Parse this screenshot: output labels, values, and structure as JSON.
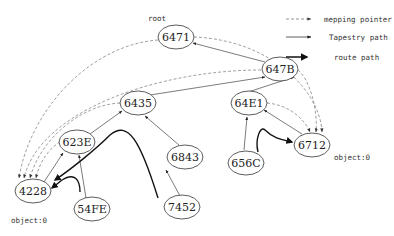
{
  "diagram": {
    "root_label": "root",
    "nodes": {
      "n6471": {
        "label": "6471",
        "cx": 176,
        "cy": 37
      },
      "n647B": {
        "label": "647B",
        "cx": 280,
        "cy": 69
      },
      "n6435": {
        "label": "6435",
        "cx": 138,
        "cy": 103
      },
      "n64E1": {
        "label": "64E1",
        "cx": 249,
        "cy": 103
      },
      "n623E": {
        "label": "623E",
        "cx": 77,
        "cy": 142
      },
      "n6843": {
        "label": "6843",
        "cx": 185,
        "cy": 157
      },
      "n656C": {
        "label": "656C",
        "cx": 246,
        "cy": 163
      },
      "n6712": {
        "label": "6712",
        "cx": 312,
        "cy": 145
      },
      "n4228": {
        "label": "4228",
        "cx": 33,
        "cy": 191
      },
      "n54FE": {
        "label": "54FE",
        "cx": 92,
        "cy": 209
      },
      "n7452": {
        "label": "7452",
        "cx": 182,
        "cy": 207
      }
    },
    "object_labels": {
      "left": "object:0",
      "right": "object:0"
    },
    "tapestry_edges": [
      [
        "54FE",
        "623E"
      ],
      [
        "623E",
        "6435"
      ],
      [
        "6435",
        "647B"
      ],
      [
        "647B",
        "6471"
      ],
      [
        "7452",
        "6843"
      ],
      [
        "6843",
        "6435"
      ],
      [
        "656C",
        "64E1"
      ],
      [
        "64E1",
        "647B"
      ],
      [
        "4228",
        "623E"
      ],
      [
        "6712",
        "64E1"
      ]
    ],
    "mapping_pointer_targets": [
      "4228",
      "6712"
    ],
    "route_paths": [
      {
        "from": "54FE",
        "to": "4228"
      },
      {
        "from": "7452",
        "to": "4228"
      },
      {
        "from": "656C",
        "to": "6712"
      }
    ]
  },
  "legend": {
    "mapping_pointer": "mepping pointer",
    "tapestry_path": "Tapestry path",
    "route_path": "route path"
  },
  "colors": {
    "stroke": "#333333",
    "dashed": "#888888",
    "background": "#ffffff"
  }
}
